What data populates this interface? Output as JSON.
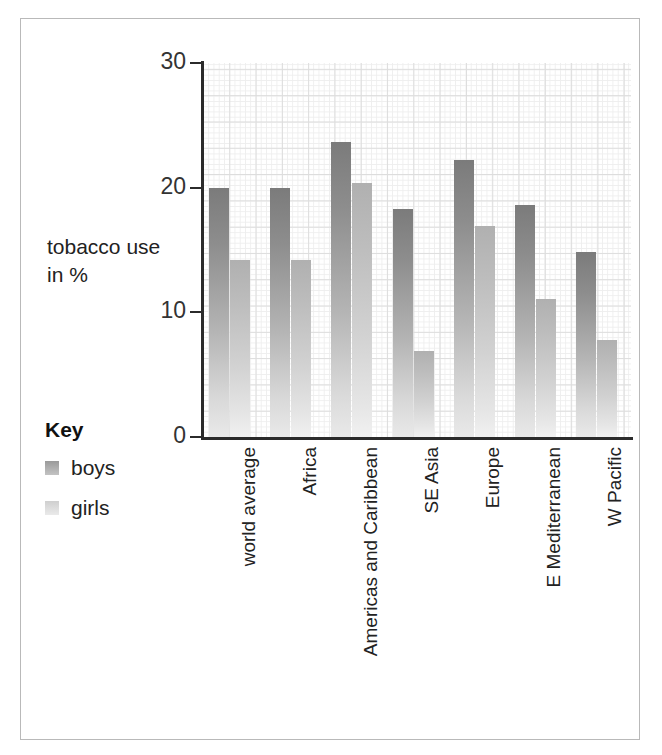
{
  "axis_title": {
    "line1": "tobacco use",
    "line2": "in %"
  },
  "legend": {
    "title": "Key",
    "items": [
      {
        "label": "boys",
        "color": "#8d8d8d"
      },
      {
        "label": "girls",
        "color": "#cfcfcf"
      }
    ]
  },
  "chart_data": {
    "type": "bar",
    "title": "",
    "xlabel": "",
    "ylabel": "tobacco use in %",
    "ylim": [
      0,
      30
    ],
    "yticks": [
      0,
      10,
      20,
      30
    ],
    "ytick_labels": [
      "0",
      "10",
      "20",
      "30"
    ],
    "grid": true,
    "legend_position": "left",
    "categories": [
      "world average",
      "Africa",
      "Americas and Caribbean",
      "SE Asia",
      "Europe",
      "E Mediterranean",
      "W Pacific"
    ],
    "series": [
      {
        "name": "boys",
        "color": "#8d8d8d",
        "values": [
          20.0,
          20.0,
          23.7,
          18.3,
          22.2,
          18.6,
          14.8
        ]
      },
      {
        "name": "girls",
        "color": "#cfcfcf",
        "values": [
          14.2,
          14.2,
          20.4,
          6.9,
          16.9,
          11.1,
          7.8
        ]
      }
    ]
  }
}
